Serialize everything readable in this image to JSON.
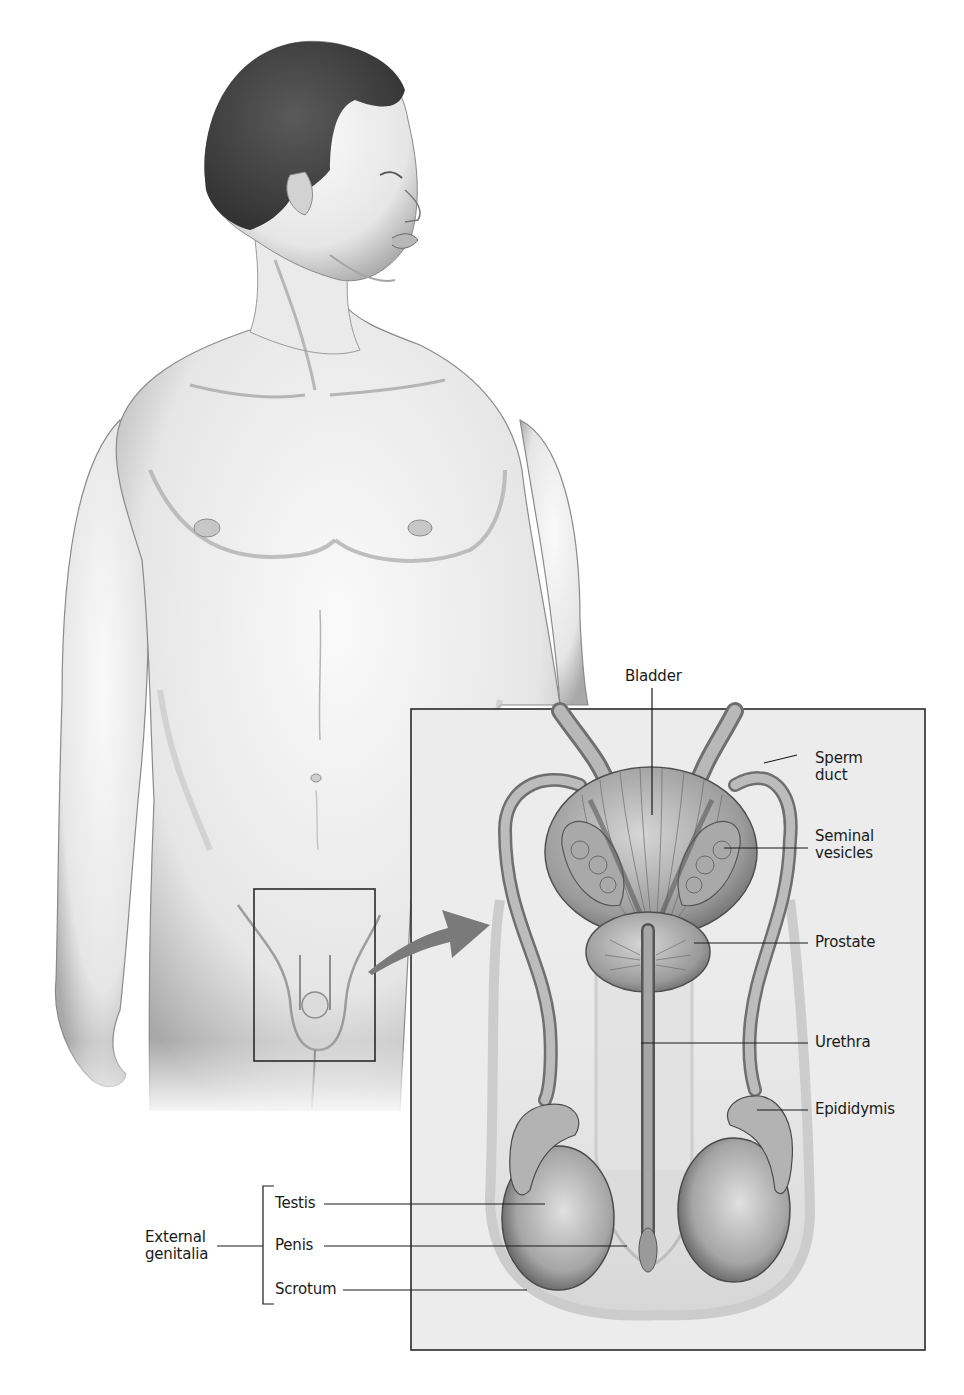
{
  "figure": {
    "callout_box": "magnified region of groin",
    "arrow": "points from groin region to magnified inset"
  },
  "labels": {
    "bladder": "Bladder",
    "sperm_duct": "Sperm\nduct",
    "seminal_vesicles": "Seminal\nvesicles",
    "prostate": "Prostate",
    "urethra": "Urethra",
    "epididymis": "Epididymis",
    "testis": "Testis",
    "penis": "Penis",
    "scrotum": "Scrotum",
    "external_genitalia": "External\ngenitalia"
  },
  "groups": {
    "external_genitalia_members": [
      "Testis",
      "Penis",
      "Scrotum"
    ]
  },
  "colors": {
    "line": "#1a1a1a",
    "inset_bg": "#ededed",
    "arrow": "#7a7a7a",
    "skin_light": "#f2f2f2",
    "skin_shade": "#9a9a9a",
    "hair": "#3c3c3c",
    "organ": "#8d8d8d"
  }
}
